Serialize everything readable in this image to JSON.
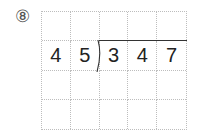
{
  "problem": {
    "number_label": "⑧",
    "divisor": [
      "4",
      "5"
    ],
    "dividend": [
      "3",
      "4",
      "7"
    ],
    "grid": {
      "columns": 5,
      "rows": 4
    },
    "rows": [
      [
        "",
        "",
        "",
        "",
        ""
      ],
      [
        "4",
        "5",
        "3",
        "4",
        "7"
      ],
      [
        "",
        "",
        "",
        "",
        ""
      ],
      [
        "",
        "",
        "",
        "",
        ""
      ]
    ]
  }
}
